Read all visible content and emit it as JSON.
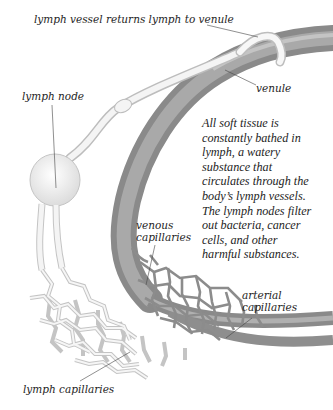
{
  "diagram": {
    "type": "anatomical-illustration",
    "labels": {
      "lymph_vessel_returns": "lymph vessel returns lymph to venule",
      "venule": "venule",
      "lymph_node": "lymph node",
      "venous_capillaries_line1": "venous",
      "venous_capillaries_line2": "capillaries",
      "arterial_capillaries_line1": "arterial",
      "arterial_capillaries_line2": "capillaries",
      "lymph_capillaries": "lymph capillaries"
    },
    "description_lines": [
      "All soft tissue is",
      "constantly bathed in",
      "lymph, a watery",
      "substance that",
      "circulates through the",
      "body’s lymph vessels.",
      "The lymph nodes filter",
      "out bacteria, cancer",
      "cells, and other",
      "harmful substances."
    ],
    "colors": {
      "blood_vessel": "#8c8c8c",
      "blood_vessel_light": "#b5b5b5",
      "lymph_vessel": "#f2f2f2",
      "lymph_outline": "#bdbdbd",
      "text": "#1e1e1e",
      "leader_line": "#444444"
    }
  }
}
